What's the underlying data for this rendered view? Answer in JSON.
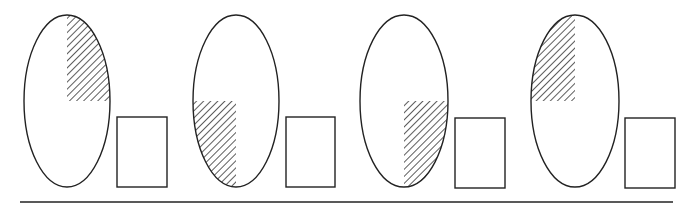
{
  "diagram": {
    "type": "pattern-sequence",
    "stroke_color": "#222222",
    "hatch_color": "#333333",
    "baseline": {
      "x1": 20,
      "x2": 673,
      "y": 202
    },
    "figures": [
      {
        "id": 1,
        "oval": {
          "cx": 67,
          "cy": 101,
          "rx": 43,
          "ry": 86
        },
        "shaded_quadrant": "top-right",
        "answer_box": {
          "x": 117,
          "y": 117,
          "w": 50,
          "h": 70
        }
      },
      {
        "id": 2,
        "oval": {
          "cx": 236,
          "cy": 101,
          "rx": 43,
          "ry": 86
        },
        "shaded_quadrant": "bottom-left",
        "answer_box": {
          "x": 286,
          "y": 117,
          "w": 49,
          "h": 70
        }
      },
      {
        "id": 3,
        "oval": {
          "cx": 404,
          "cy": 101,
          "rx": 44,
          "ry": 86
        },
        "shaded_quadrant": "bottom-right",
        "answer_box": {
          "x": 455,
          "y": 118,
          "w": 50,
          "h": 70
        }
      },
      {
        "id": 4,
        "oval": {
          "cx": 575,
          "cy": 101,
          "rx": 44,
          "ry": 86
        },
        "shaded_quadrant": "top-left",
        "answer_box": {
          "x": 625,
          "y": 118,
          "w": 50,
          "h": 70
        }
      }
    ]
  }
}
